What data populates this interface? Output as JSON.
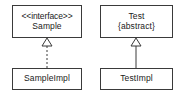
{
  "diagram": {
    "type": "uml-class-diagram",
    "width": 188,
    "height": 97,
    "background_color": "#ffffff",
    "border_color": "#3a3a3a",
    "text_color": "#1a1a1a",
    "classes": [
      {
        "id": "sample",
        "stereotype": "<<interface>>",
        "name": "Sample",
        "modifier": ""
      },
      {
        "id": "test",
        "stereotype": "",
        "name": "Test",
        "modifier": "{abstract}"
      },
      {
        "id": "sample_impl",
        "stereotype": "",
        "name": "SampleImpl",
        "modifier": ""
      },
      {
        "id": "test_impl",
        "stereotype": "",
        "name": "TestImpl",
        "modifier": ""
      }
    ],
    "relationships": [
      {
        "id": "realization",
        "kind": "realization",
        "line_style": "dashed",
        "arrowhead": "hollow-triangle",
        "from": "SampleImpl",
        "to": "Sample"
      },
      {
        "id": "generalization",
        "kind": "generalization",
        "line_style": "solid",
        "arrowhead": "hollow-triangle",
        "from": "TestImpl",
        "to": "Test"
      }
    ]
  }
}
